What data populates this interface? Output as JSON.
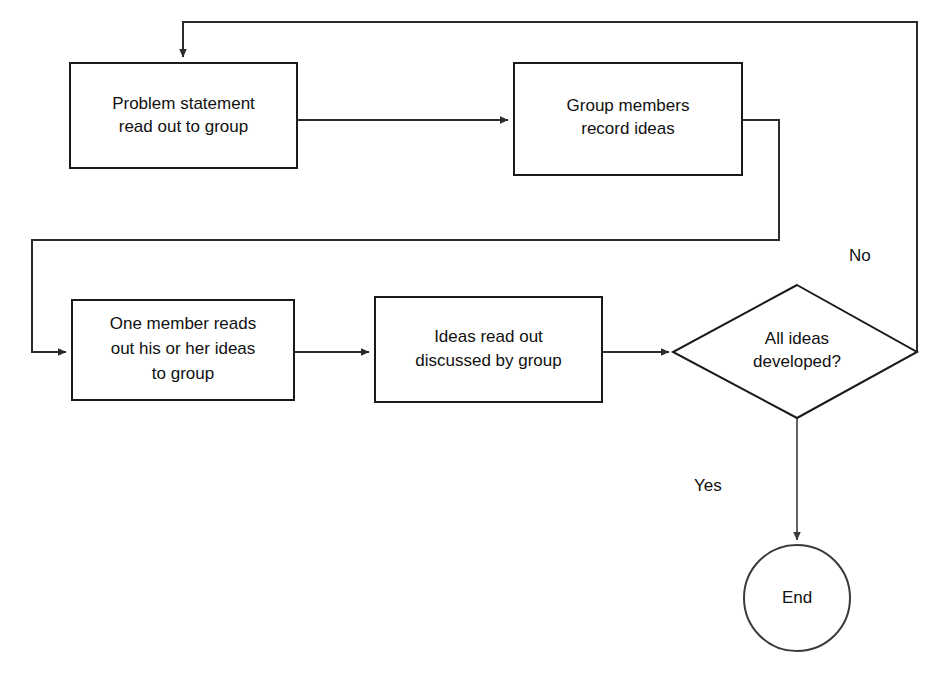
{
  "diagram": {
    "type": "flowchart",
    "background_color": "#ffffff",
    "line_color": "#2b2b2b",
    "text_color": "#111111",
    "nodes": [
      {
        "id": "problem-statement",
        "shape": "process",
        "lines": [
          "Problem statement",
          "read out to group"
        ],
        "line1": "Problem statement",
        "line2": "read out to group"
      },
      {
        "id": "record-ideas",
        "shape": "process",
        "lines": [
          "Group members",
          "record ideas"
        ],
        "line1": "Group members",
        "line2": "record ideas"
      },
      {
        "id": "one-member-reads",
        "shape": "process",
        "lines": [
          "One member reads",
          "out his or her ideas",
          "to group"
        ],
        "line1": "One member reads",
        "line2": "out his or her ideas",
        "line3": "to group"
      },
      {
        "id": "ideas-discussed",
        "shape": "process",
        "lines": [
          "Ideas read out",
          "discussed by group"
        ],
        "line1": "Ideas read out",
        "line2": "discussed by group"
      },
      {
        "id": "all-ideas-developed",
        "shape": "decision",
        "lines": [
          "All ideas",
          "developed?"
        ],
        "line1": "All ideas",
        "line2": "developed?"
      },
      {
        "id": "end",
        "shape": "terminator-circle",
        "lines": [
          "End"
        ],
        "line1": "End"
      }
    ],
    "edge_labels": {
      "no": "No",
      "yes": "Yes"
    }
  }
}
